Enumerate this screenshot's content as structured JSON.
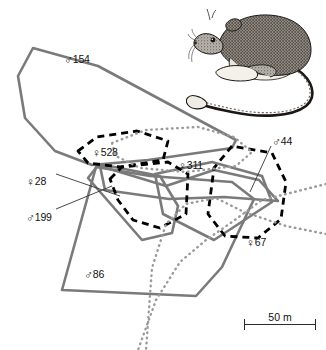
{
  "figure": {
    "type": "home-range-map",
    "background_color": "#ffffff"
  },
  "colors": {
    "gray_range": "#7a7a7a",
    "black_range": "#000000",
    "dotted_gray": "#9a9a9a",
    "label_text": "#111111",
    "scalebar": "#2b2b2b"
  },
  "animals": [
    {
      "id": "154",
      "sex": "male",
      "sex_symbol": "♂",
      "label": "154",
      "style": "solid",
      "color": "#7a7a7a",
      "label_x": 64,
      "label_y": 54,
      "leader": null
    },
    {
      "id": "528",
      "sex": "female",
      "sex_symbol": "♀",
      "label": "528",
      "style": "dashed",
      "color": "#000000",
      "label_x": 92,
      "label_y": 147,
      "leader": null
    },
    {
      "id": "28",
      "sex": "female",
      "sex_symbol": "♀",
      "label": "28",
      "style": "solid",
      "color": "#7a7a7a",
      "label_x": 26,
      "label_y": 176,
      "leader": "line to central polygon"
    },
    {
      "id": "199",
      "sex": "male",
      "sex_symbol": "♂",
      "label": "199",
      "style": "solid",
      "color": "#7a7a7a",
      "label_x": 26,
      "label_y": 212,
      "leader": "line to central polygon"
    },
    {
      "id": "311",
      "sex": "female",
      "sex_symbol": "♀",
      "label": "311",
      "style": "dotted",
      "color": "#9a9a9a",
      "label_x": 178,
      "label_y": 160,
      "leader": null
    },
    {
      "id": "44",
      "sex": "male",
      "sex_symbol": "♂",
      "label": "44",
      "style": "dashed",
      "color": "#000000",
      "label_x": 272,
      "label_y": 136,
      "leader": "line to right polygon edge"
    },
    {
      "id": "67",
      "sex": "female",
      "sex_symbol": "♀",
      "label": "67",
      "style": "dotted",
      "color": "#9a9a9a",
      "label_x": 246,
      "label_y": 237,
      "leader": null
    },
    {
      "id": "86",
      "sex": "male",
      "sex_symbol": "♂",
      "label": "86",
      "style": "solid",
      "color": "#7a7a7a",
      "label_x": 84,
      "label_y": 269,
      "leader": null
    }
  ],
  "scale_bar": {
    "label": "50 m",
    "length_px": 72,
    "value": 50,
    "unit": "m"
  },
  "illustration": {
    "name": "rodent-illustration",
    "subject": "kangaroo rat",
    "description": "ink drawing of a long-tailed rodent with tufted tail tip, facing left"
  }
}
